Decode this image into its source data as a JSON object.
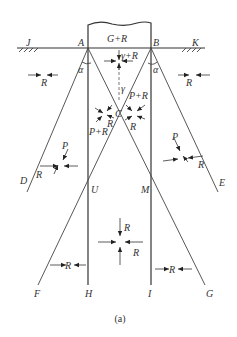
{
  "points": {
    "J": "J",
    "A": "A",
    "B": "B",
    "K": "K",
    "C": "C",
    "D": "D",
    "E": "E",
    "U": "U",
    "M": "M",
    "F": "F",
    "H": "H",
    "I": "I",
    "G": "G"
  },
  "labels": {
    "footing": "G+R",
    "top_stress": "γ+R",
    "gamma": "γ",
    "alpha": "α",
    "R": "R",
    "P": "P",
    "P_plus_R": "P+R"
  },
  "caption": "(a)"
}
